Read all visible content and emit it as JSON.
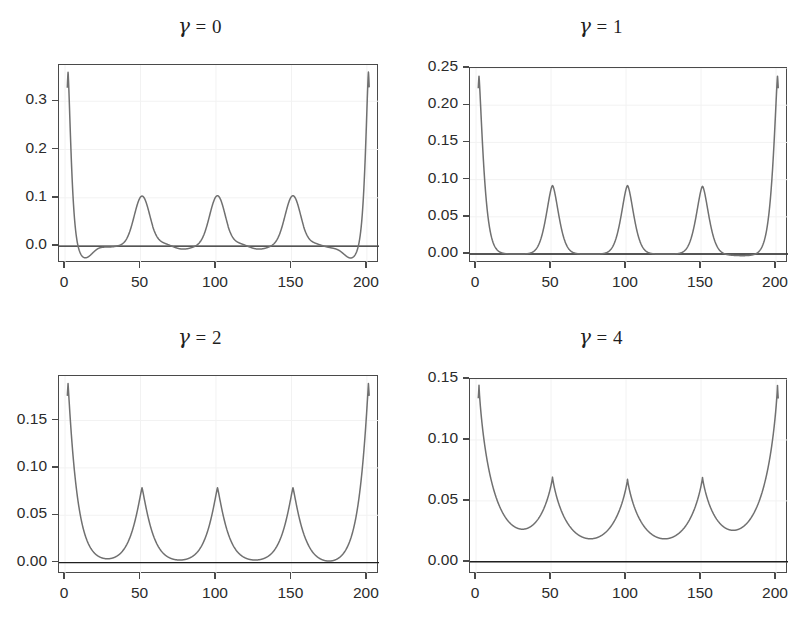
{
  "figure": {
    "width": 801,
    "height": 622,
    "background": "#ffffff",
    "curve_color": "#707070",
    "axis_color": "#4a4a4a",
    "grid_color": "#f2f2f2",
    "zero_line_color": "#1f1f1f"
  },
  "chart_data": [
    {
      "type": "line",
      "title": "γ = 0",
      "gamma": 0,
      "xlabel": "",
      "ylabel": "",
      "xlim": [
        -4,
        208
      ],
      "ylim": [
        -0.035,
        0.375
      ],
      "xticks": [
        0,
        50,
        100,
        150,
        200
      ],
      "xticklabels": [
        "0",
        "50",
        "100",
        "150",
        "200"
      ],
      "yticks": [
        0.0,
        0.1,
        0.2,
        0.3
      ],
      "yticklabels": [
        "0.0",
        "0.1",
        "0.2",
        "0.3"
      ],
      "grid": true,
      "legend": "none",
      "zero_line": true,
      "peaks": [
        {
          "x": 2,
          "y": 0.362,
          "type": "boundary-left"
        },
        {
          "x": 51,
          "y": 0.108,
          "type": "interior"
        },
        {
          "x": 101,
          "y": 0.108,
          "type": "interior"
        },
        {
          "x": 151,
          "y": 0.108,
          "type": "interior"
        },
        {
          "x": 201,
          "y": 0.362,
          "type": "boundary-right"
        }
      ],
      "undershoot": {
        "x": 13,
        "y": -0.025,
        "mirrored_x": 190
      },
      "baseline": 0.0,
      "description": "Oscillating kernel with negative side-lobes near boundaries; narrow Gaussian-like interior peaks at 50, 100, 150."
    },
    {
      "type": "line",
      "title": "γ = 1",
      "gamma": 1,
      "xlabel": "",
      "ylabel": "",
      "xlim": [
        -4,
        208
      ],
      "ylim": [
        -0.012,
        0.25
      ],
      "xticks": [
        0,
        50,
        100,
        150,
        200
      ],
      "xticklabels": [
        "0",
        "50",
        "100",
        "150",
        "200"
      ],
      "yticks": [
        0.0,
        0.05,
        0.1,
        0.15,
        0.2,
        0.25
      ],
      "yticklabels": [
        "0.00",
        "0.05",
        "0.10",
        "0.15",
        "0.20",
        "0.25"
      ],
      "grid": true,
      "legend": "none",
      "zero_line": true,
      "peaks": [
        {
          "x": 2,
          "y": 0.239,
          "type": "boundary-left"
        },
        {
          "x": 51,
          "y": 0.092,
          "type": "interior"
        },
        {
          "x": 101,
          "y": 0.092,
          "type": "interior"
        },
        {
          "x": 151,
          "y": 0.091,
          "type": "interior"
        },
        {
          "x": 201,
          "y": 0.239,
          "type": "boundary-right"
        }
      ],
      "baseline": 0.0,
      "description": "Non-negative peaks, nearly flat near zero between peaks."
    },
    {
      "type": "line",
      "title": "γ = 2",
      "gamma": 2,
      "xlabel": "",
      "ylabel": "",
      "xlim": [
        -4,
        208
      ],
      "ylim": [
        -0.012,
        0.197
      ],
      "xticks": [
        0,
        50,
        100,
        150,
        200
      ],
      "xticklabels": [
        "0",
        "50",
        "100",
        "150",
        "200"
      ],
      "yticks": [
        0.0,
        0.05,
        0.1,
        0.15
      ],
      "yticklabels": [
        "0.00",
        "0.05",
        "0.10",
        "0.15"
      ],
      "grid": true,
      "legend": "none",
      "zero_line": true,
      "peaks": [
        {
          "x": 2,
          "y": 0.189,
          "type": "boundary-left"
        },
        {
          "x": 51,
          "y": 0.079,
          "type": "interior"
        },
        {
          "x": 101,
          "y": 0.079,
          "type": "interior"
        },
        {
          "x": 151,
          "y": 0.079,
          "type": "interior"
        },
        {
          "x": 201,
          "y": 0.189,
          "type": "boundary-right"
        }
      ],
      "baseline": 0.0,
      "description": "Broader tails than gamma = 1; peaks slightly lower."
    },
    {
      "type": "line",
      "title": "γ = 4",
      "gamma": 4,
      "xlabel": "",
      "ylabel": "",
      "xlim": [
        -4,
        208
      ],
      "ylim": [
        -0.01,
        0.15
      ],
      "xticks": [
        0,
        50,
        100,
        150,
        200
      ],
      "xticklabels": [
        "0",
        "50",
        "100",
        "150",
        "200"
      ],
      "yticks": [
        0.0,
        0.05,
        0.1,
        0.15
      ],
      "yticklabels": [
        "0.00",
        "0.05",
        "0.10",
        "0.15"
      ],
      "grid": true,
      "legend": "none",
      "zero_line": true,
      "peaks": [
        {
          "x": 2,
          "y": 0.143,
          "type": "boundary-left"
        },
        {
          "x": 51,
          "y": 0.064,
          "type": "interior"
        },
        {
          "x": 101,
          "y": 0.064,
          "type": "interior"
        },
        {
          "x": 151,
          "y": 0.064,
          "type": "interior"
        },
        {
          "x": 201,
          "y": 0.143,
          "type": "boundary-right"
        }
      ],
      "baseline": 0.0,
      "description": "Widest, cusp-shaped peaks with heavy tails; valleys touch zero."
    }
  ],
  "panels": [
    {
      "id": "panel-gamma-0",
      "title_html_prefix": "γ",
      "title_suffix": " = 0"
    },
    {
      "id": "panel-gamma-1",
      "title_html_prefix": "γ",
      "title_suffix": " = 1"
    },
    {
      "id": "panel-gamma-2",
      "title_html_prefix": "γ",
      "title_suffix": " = 2"
    },
    {
      "id": "panel-gamma-4",
      "title_html_prefix": "γ",
      "title_suffix": " = 4"
    }
  ]
}
